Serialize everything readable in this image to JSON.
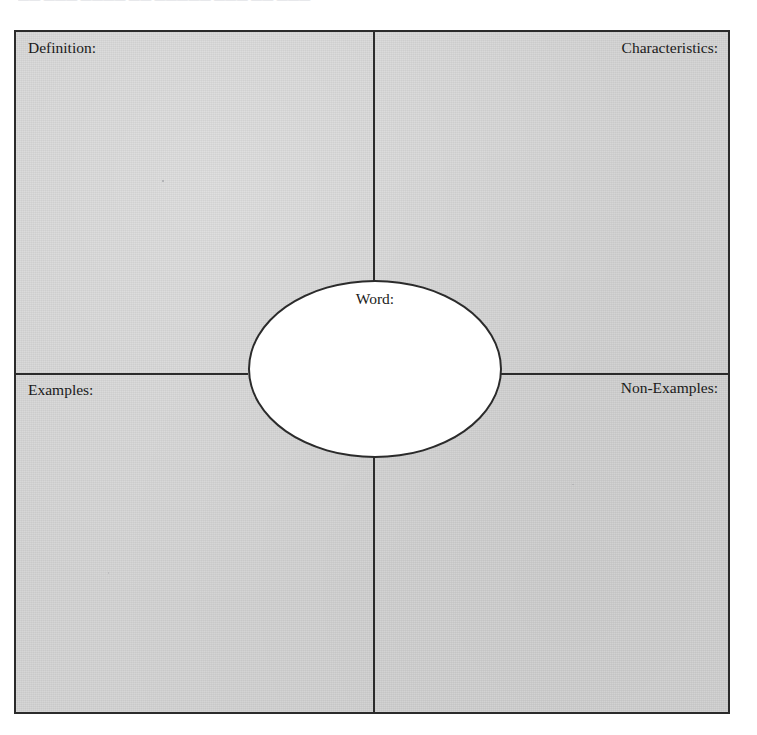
{
  "page": {
    "header_fragment": "―― ――― ――――  ――  ―――――  ―――  ―― ―――",
    "paper_color": "#ffffff"
  },
  "organizer": {
    "type": "frayer-model",
    "fill_color": "#d2d2d2",
    "line_color": "#2b2b2b",
    "center": {
      "label": "Word:",
      "fill_color": "#ffffff"
    },
    "quadrants": [
      {
        "id": "definition",
        "label": "Definition:",
        "position": "top-left",
        "align": "left",
        "value": ""
      },
      {
        "id": "characteristics",
        "label": "Characteristics:",
        "position": "top-right",
        "align": "right",
        "value": ""
      },
      {
        "id": "examples",
        "label": "Examples:",
        "position": "bottom-left",
        "align": "left",
        "value": ""
      },
      {
        "id": "non-examples",
        "label": "Non-Examples:",
        "position": "bottom-right",
        "align": "right",
        "value": ""
      }
    ]
  }
}
